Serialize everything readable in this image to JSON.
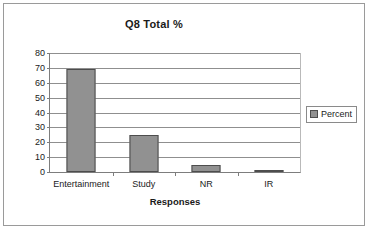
{
  "chart_data": {
    "type": "bar",
    "title": "Q8 Total %",
    "xlabel": "Responses",
    "ylabel": "",
    "categories": [
      "Entertainment",
      "Study",
      "NR",
      "IR"
    ],
    "values": [
      69.5,
      25,
      5,
      1.5
    ],
    "series": [
      {
        "name": "Percent",
        "values": [
          69.5,
          25,
          5,
          1.5
        ]
      }
    ],
    "ylim": [
      0,
      80
    ],
    "ytick_step": 10,
    "yticks": [
      0,
      10,
      20,
      30,
      40,
      50,
      60,
      70,
      80
    ],
    "ytick_labels": [
      "0",
      "10",
      "20",
      "30",
      "40",
      "50",
      "60",
      "70",
      "80"
    ],
    "grid": true,
    "grid_axis": "y",
    "legend": {
      "position": "right",
      "entries": [
        "Percent"
      ]
    },
    "colors": {
      "bar_fill": "#919191",
      "bar_border": "#4d4d4d",
      "gridline": "#8f8f8f",
      "axis": "#7d7d7d",
      "text": "#1a1a1a",
      "frame_border": "#9a9a9a",
      "plot_background": "#ffffff"
    }
  }
}
